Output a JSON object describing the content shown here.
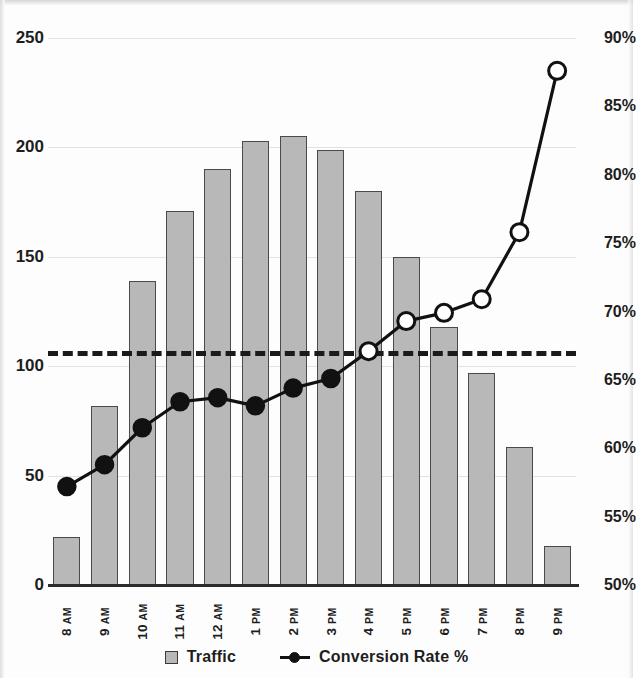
{
  "chart_data": {
    "type": "bar",
    "title": "",
    "subtitle": "",
    "xlabel": "",
    "ylabel": "",
    "y2label": "",
    "grid": true,
    "legend_position": "bottom",
    "categories": [
      "8 AM",
      "9 AM",
      "10 AM",
      "11 AM",
      "12 AM",
      "1 PM",
      "2 PM",
      "3 PM",
      "4 PM",
      "5 PM",
      "6 PM",
      "7 PM",
      "8 PM",
      "9 PM"
    ],
    "category_parts": [
      {
        "num": "8",
        "suffix": "AM"
      },
      {
        "num": "9",
        "suffix": "AM"
      },
      {
        "num": "10",
        "suffix": "AM"
      },
      {
        "num": "11",
        "suffix": "AM"
      },
      {
        "num": "12",
        "suffix": "AM"
      },
      {
        "num": "1",
        "suffix": "PM"
      },
      {
        "num": "2",
        "suffix": "PM"
      },
      {
        "num": "3",
        "suffix": "PM"
      },
      {
        "num": "4",
        "suffix": "PM"
      },
      {
        "num": "5",
        "suffix": "PM"
      },
      {
        "num": "6",
        "suffix": "PM"
      },
      {
        "num": "7",
        "suffix": "PM"
      },
      {
        "num": "8",
        "suffix": "PM"
      },
      {
        "num": "9",
        "suffix": "PM"
      }
    ],
    "series": [
      {
        "name": "Traffic",
        "type": "bar",
        "axis": "left",
        "color": "#b8b8b8",
        "edge_color": "#4a4a4a",
        "values": [
          22,
          82,
          139,
          171,
          190,
          203,
          205,
          199,
          180,
          150,
          118,
          97,
          63,
          18
        ]
      },
      {
        "name": "Conversion Rate %",
        "type": "line",
        "axis": "right",
        "color": "#111111",
        "values": [
          57.2,
          58.8,
          61.5,
          63.4,
          63.7,
          63.1,
          64.4,
          65.1,
          67.1,
          69.3,
          69.9,
          70.9,
          75.8,
          87.6
        ],
        "marker_filled": [
          true,
          true,
          true,
          true,
          true,
          true,
          true,
          true,
          false,
          false,
          false,
          false,
          false,
          false
        ]
      }
    ],
    "threshold_line": {
      "label": "",
      "left_axis_value": 107,
      "right_axis_value": 67.1,
      "style": "dashed",
      "color": "#1a1a1a"
    },
    "y_axis_left": {
      "ticks": [
        "0",
        "50",
        "100",
        "150",
        "200",
        "250"
      ],
      "tick_values": [
        0,
        50,
        100,
        150,
        200,
        250
      ],
      "ylim": [
        0,
        250
      ]
    },
    "y_axis_right": {
      "ticks": [
        "50%",
        "55%",
        "60%",
        "65%",
        "70%",
        "75%",
        "80%",
        "85%",
        "90%"
      ],
      "tick_values": [
        50,
        55,
        60,
        65,
        70,
        75,
        80,
        85,
        90
      ],
      "ylim": [
        50,
        90
      ]
    },
    "legend": [
      {
        "label": "Traffic",
        "marker": "square-swatch"
      },
      {
        "label": "Conversion Rate %",
        "marker": "line-dot"
      }
    ]
  }
}
